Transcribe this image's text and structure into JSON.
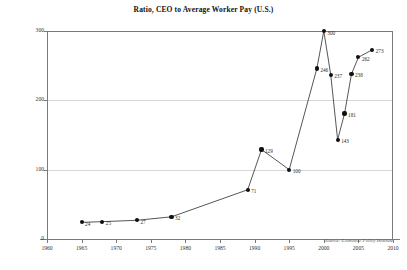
{
  "chart_data": {
    "type": "line",
    "title": "Ratio, CEO to Average Worker Pay (U.S.)",
    "xlabel": "",
    "ylabel": "",
    "xlim": [
      1960,
      2010
    ],
    "ylim": [
      0,
      300
    ],
    "grid": true,
    "legend": false,
    "source_note": "Source: Economic Policy Institute",
    "xticks": [
      1960,
      1965,
      1970,
      1975,
      1980,
      1985,
      1990,
      1995,
      2000,
      2005,
      2010
    ],
    "xtick_labels": [
      "1960",
      "1965",
      "1970",
      "1975",
      "1980",
      "1985",
      "1990",
      "1995",
      "2000",
      "2005",
      "2010"
    ],
    "yticks": [
      0,
      100,
      200,
      300
    ],
    "ytick_labels": [
      "0",
      "100",
      "200",
      "300"
    ],
    "series_name": "CEO to average worker pay ratio",
    "points": [
      {
        "x": 1965,
        "y": 24,
        "label": "24"
      },
      {
        "x": 1968,
        "y": 25,
        "label": "25"
      },
      {
        "x": 1973,
        "y": 27,
        "label": "27"
      },
      {
        "x": 1978,
        "y": 32,
        "label": "32"
      },
      {
        "x": 1989,
        "y": 71,
        "label": "71"
      },
      {
        "x": 1991,
        "y": 129,
        "label": "129"
      },
      {
        "x": 1995,
        "y": 100,
        "label": "100"
      },
      {
        "x": 1999,
        "y": 246,
        "label": "246"
      },
      {
        "x": 2000,
        "y": 300,
        "label": "300"
      },
      {
        "x": 2001,
        "y": 237,
        "label": "237"
      },
      {
        "x": 2002,
        "y": 143,
        "label": "143"
      },
      {
        "x": 2003,
        "y": 181,
        "label": "181"
      },
      {
        "x": 2004,
        "y": 238,
        "label": "238"
      },
      {
        "x": 2005,
        "y": 262,
        "label": "262"
      },
      {
        "x": 2007,
        "y": 273,
        "label": "273"
      }
    ]
  }
}
